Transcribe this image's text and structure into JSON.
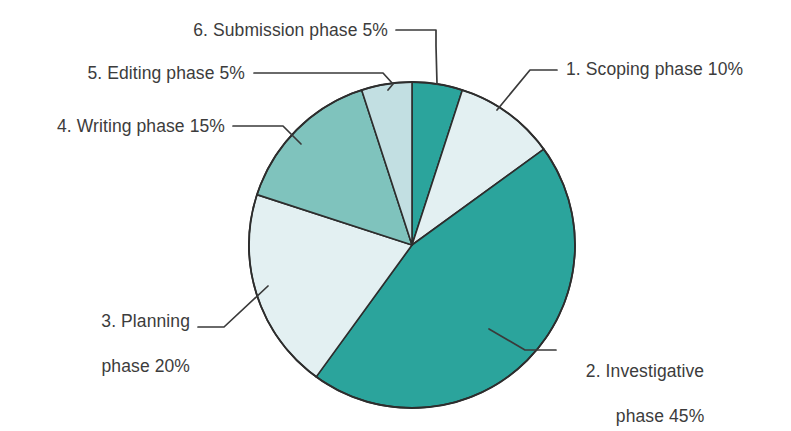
{
  "chart_data": {
    "type": "pie",
    "title": "",
    "subtitle": "",
    "xlabel": "",
    "ylabel": "",
    "legend_position": "none",
    "grid": false,
    "units": "percent",
    "total": 100,
    "start_angle_deg": 0,
    "direction": "clockwise",
    "categories": [
      "1. Scoping phase",
      "2. Investigative phase",
      "3. Planning phase",
      "4. Writing phase",
      "5. Editing phase",
      "6. Submission phase"
    ],
    "values": [
      10,
      45,
      20,
      15,
      5,
      5
    ],
    "slices": [
      {
        "index": 6,
        "name": "6. Submission phase",
        "value": 5,
        "label": "6. Submission phase 5%",
        "color": "#2BA49C",
        "start_deg": 0,
        "end_deg": 18
      },
      {
        "index": 1,
        "name": "1. Scoping phase",
        "value": 10,
        "label": "1. Scoping phase 10%",
        "color": "#E3F0F2",
        "start_deg": 18,
        "end_deg": 54
      },
      {
        "index": 2,
        "name": "2. Investigative phase",
        "value": 45,
        "label": "2. Investigative phase 45%",
        "label_line1": "2. Investigative",
        "label_line2": "phase 45%",
        "color": "#2BA49C",
        "start_deg": 54,
        "end_deg": 216
      },
      {
        "index": 3,
        "name": "3. Planning phase",
        "value": 20,
        "label": "3. Planning phase 20%",
        "label_line1": "3. Planning",
        "label_line2": "phase 20%",
        "color": "#E3F0F2",
        "start_deg": 216,
        "end_deg": 288
      },
      {
        "index": 4,
        "name": "4. Writing phase",
        "value": 15,
        "label": "4. Writing phase 15%",
        "color": "#7FC3BD",
        "start_deg": 288,
        "end_deg": 342
      },
      {
        "index": 5,
        "name": "5. Editing phase",
        "value": 5,
        "label": "5. Editing phase 5%",
        "color": "#C2DFE2",
        "start_deg": 342,
        "end_deg": 360
      }
    ]
  },
  "labels": {
    "scoping": "1. Scoping phase 10%",
    "investigative_line1": "2. Investigative",
    "investigative_line2": "phase 45%",
    "planning_line1": "3. Planning",
    "planning_line2": "phase 20%",
    "writing": "4. Writing phase 15%",
    "editing": "5. Editing phase 5%",
    "submission": "6. Submission phase 5%"
  },
  "colors": {
    "slice_dark_teal": "#2BA49C",
    "slice_pale": "#E3F0F2",
    "slice_muted_teal": "#7FC3BD",
    "slice_pale_cyan": "#C2DFE2",
    "outline": "#2d2d2d",
    "leader_line": "#3a3a3a",
    "text": "#3c3c3c",
    "background": "#ffffff"
  }
}
